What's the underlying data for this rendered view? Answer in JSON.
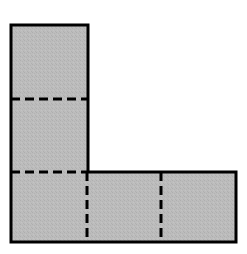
{
  "figure": {
    "shape_name": "l-shape-polygon",
    "canvas": {
      "width": 247,
      "height": 254,
      "background_color": "#ffffff"
    },
    "style": {
      "fill_color": "#b9b9b9",
      "fill_texture": "fine-stipple",
      "outline_color": "#000000",
      "outline_width": 3,
      "dash_color": "#000000",
      "dash_width": 3,
      "dash_pattern": "9 5"
    },
    "outline": {
      "label": "L-shape outline",
      "points": "11,25 88,25 88,172 236,172 236,242 11,242"
    },
    "vertical_arm": {
      "label": "vertical arm",
      "x": 11,
      "y": 25,
      "width": 77,
      "height": 147
    },
    "horizontal_arm": {
      "label": "horizontal arm",
      "x": 11,
      "y": 172,
      "width": 225,
      "height": 70
    },
    "dashed_dividers": [
      {
        "name": "divider-horizontal-upper",
        "orientation": "horizontal",
        "x1": 11,
        "y1": 99,
        "x2": 88,
        "y2": 99
      },
      {
        "name": "divider-horizontal-lower",
        "orientation": "horizontal",
        "x1": 11,
        "y1": 172,
        "x2": 88,
        "y2": 172
      },
      {
        "name": "divider-vertical-left",
        "orientation": "vertical",
        "x1": 87,
        "y1": 172,
        "x2": 87,
        "y2": 242
      },
      {
        "name": "divider-vertical-right",
        "orientation": "vertical",
        "x1": 161,
        "y1": 172,
        "x2": 161,
        "y2": 242
      }
    ],
    "cells": [
      {
        "name": "cell-top",
        "x": 11,
        "y": 25,
        "width": 77,
        "height": 74
      },
      {
        "name": "cell-middle",
        "x": 11,
        "y": 99,
        "width": 77,
        "height": 73
      },
      {
        "name": "cell-bottom-left",
        "x": 11,
        "y": 172,
        "width": 76,
        "height": 70
      },
      {
        "name": "cell-bottom-center",
        "x": 87,
        "y": 172,
        "width": 74,
        "height": 70
      },
      {
        "name": "cell-bottom-right",
        "x": 161,
        "y": 172,
        "width": 75,
        "height": 70
      }
    ],
    "cell_count": 5
  }
}
